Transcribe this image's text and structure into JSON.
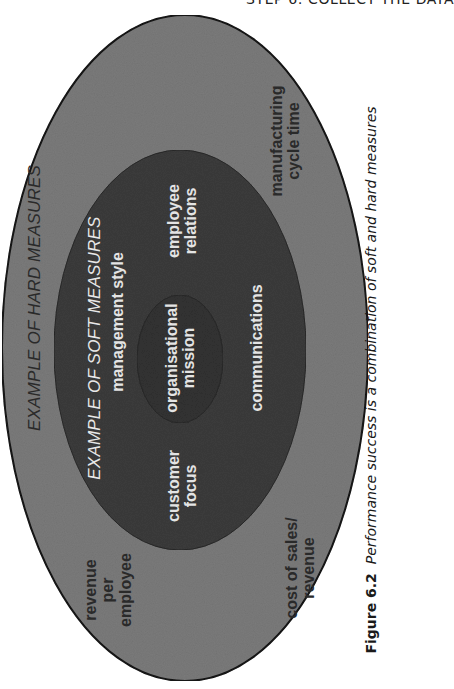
{
  "running_header": "STEP 6: COLLECT THE DATA",
  "diagram": {
    "orientation": "rotated 90deg counter-clockwise",
    "colors": {
      "page_background": "#ffffff",
      "outer_ellipse_fill": "#7d7d7d",
      "middle_ellipse_fill": "#3e3e3e",
      "inner_ellipse_fill": "#353535",
      "outline": "#1a1a1a"
    },
    "outer_ring": {
      "title": "EXAMPLE OF HARD MEASURES",
      "items": [
        {
          "line1": "manufacturing",
          "line2": "cycle time"
        },
        {
          "line1": "revenue",
          "line2": "per",
          "line3": "employee"
        },
        {
          "line1": "cost of sales/",
          "line2": "revenue"
        }
      ]
    },
    "middle_ring": {
      "title": "EXAMPLE OF SOFT MEASURES",
      "items": [
        {
          "line1": "management style"
        },
        {
          "line1": "employee",
          "line2": "relations"
        },
        {
          "line1": "communications"
        },
        {
          "line1": "customer",
          "line2": "focus"
        }
      ]
    },
    "core": {
      "line1": "organisational",
      "line2": "mission"
    }
  },
  "caption": {
    "figure_label": "Figure 6.2",
    "text": "Performance success is a combination of soft and hard measures"
  }
}
